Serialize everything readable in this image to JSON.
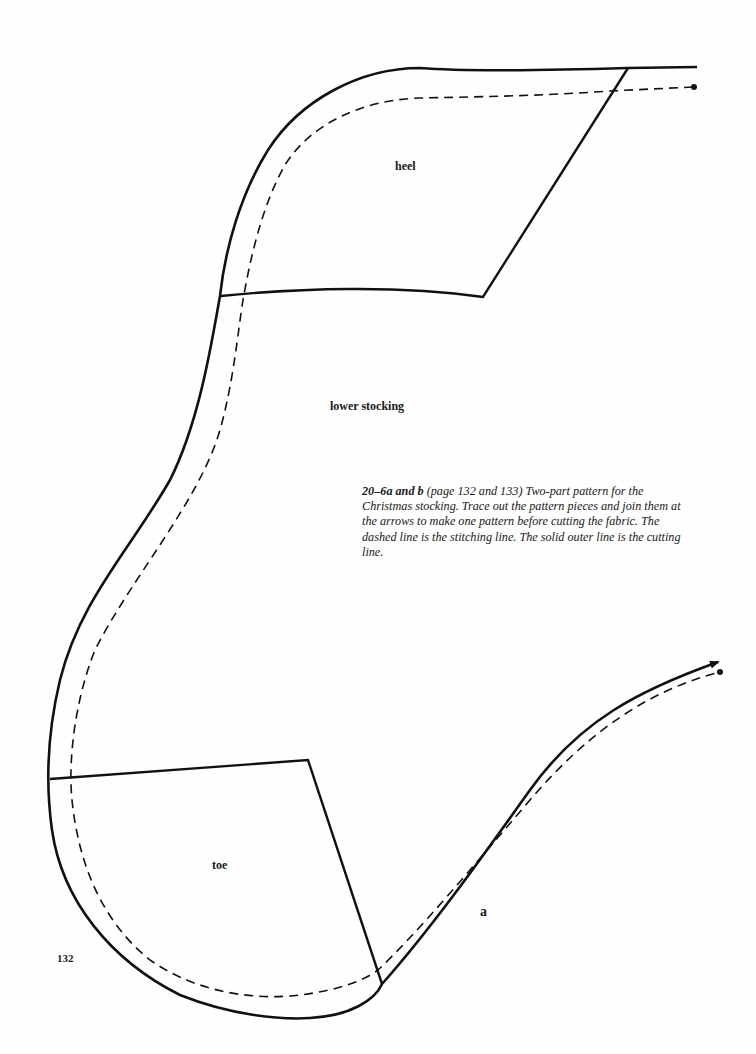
{
  "pattern": {
    "labels": {
      "heel": "heel",
      "lower_stocking": "lower stocking",
      "toe": "toe"
    },
    "piece_letter": "a",
    "line_types": {
      "solid": "cutting line",
      "dashed": "stitching line"
    },
    "colors": {
      "line": "#111111",
      "paper": "#fefefe"
    }
  },
  "caption": {
    "figure_id": "20–6a and b",
    "reference": "(page 132 and 133)",
    "text": "Two-part pattern for the Christmas stocking. Trace out the pattern pieces and join them at the arrows to make one pattern before cutting the fabric. The dashed line is the stitching line. The solid outer line is the cutting line."
  },
  "page_number": "132"
}
